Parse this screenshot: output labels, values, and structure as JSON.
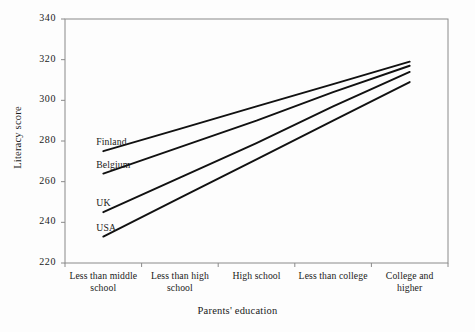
{
  "chart_data": {
    "type": "line",
    "title": "",
    "xlabel": "Parents' education",
    "ylabel": "Literacy score",
    "categories": [
      "Less than middle school",
      "Less than high school",
      "High school",
      "Less than college",
      "College and higher"
    ],
    "category_lines": [
      [
        "Less than middle",
        "school"
      ],
      [
        "Less than high",
        "school"
      ],
      [
        "High school"
      ],
      [
        "Less than college"
      ],
      [
        "College and",
        "higher"
      ]
    ],
    "ylim": [
      220,
      340
    ],
    "yticks": [
      220,
      240,
      260,
      280,
      300,
      320,
      340
    ],
    "grid": false,
    "legend_position": "inline-left",
    "series": [
      {
        "name": "Finland",
        "values": [
          275,
          286,
          297,
          308,
          319
        ]
      },
      {
        "name": "Belgium",
        "values": [
          264,
          277,
          290,
          304,
          317
        ]
      },
      {
        "name": "UK",
        "values": [
          245,
          262,
          279,
          297,
          314
        ]
      },
      {
        "name": "USA",
        "values": [
          233,
          252,
          271,
          290,
          309
        ]
      }
    ]
  },
  "axis": {
    "ytick_labels": [
      "340",
      "320",
      "300",
      "280",
      "260",
      "240",
      "220"
    ],
    "ylabel": "Literacy score",
    "xlabel": "Parents' education"
  },
  "series_labels": [
    {
      "name": "Finland"
    },
    {
      "name": "Belgium"
    },
    {
      "name": "UK"
    },
    {
      "name": "USA"
    }
  ],
  "colors": {
    "line": "#111111",
    "frame": "#8a8a8a",
    "background": "#fdfdfd",
    "text": "#1a1a1a"
  }
}
